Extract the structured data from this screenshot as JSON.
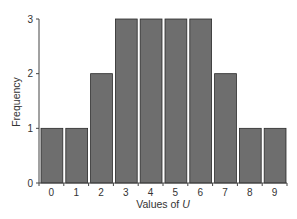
{
  "chart_data": {
    "type": "bar",
    "title": "",
    "xlabel": "Values of",
    "xlabel_var": "U",
    "ylabel": "Frequency",
    "categories": [
      "0",
      "1",
      "2",
      "3",
      "4",
      "5",
      "6",
      "7",
      "8",
      "9"
    ],
    "values": [
      1,
      1,
      2,
      3,
      3,
      3,
      3,
      2,
      1,
      1
    ],
    "ylim": [
      0,
      3
    ],
    "yticks": [
      "0",
      "1",
      "2",
      "3"
    ],
    "grid": false,
    "legend": "none",
    "bar_color": "#6e6e6e"
  }
}
